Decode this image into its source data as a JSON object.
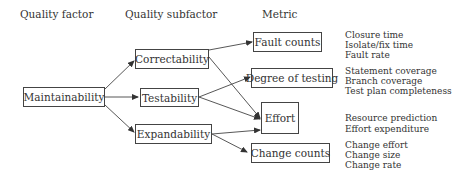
{
  "headers": {
    "quality_factor": "Quality factor",
    "quality_subfactor": "Quality subfactor",
    "metric": "Metric"
  },
  "factor": {
    "label": "Maintainability"
  },
  "subfactors": [
    {
      "id": "correctability",
      "label": "Correctability"
    },
    {
      "id": "testability",
      "label": "Testability"
    },
    {
      "id": "expandability",
      "label": "Expandability"
    }
  ],
  "metrics": [
    {
      "id": "fault-counts",
      "label": "Fault counts",
      "details": [
        "Closure time",
        "Isolate/fix time",
        "Fault rate"
      ]
    },
    {
      "id": "degree-of-testing",
      "label": "Degree of testing",
      "details": [
        "Statement coverage",
        "Branch coverage",
        "Test plan completeness"
      ]
    },
    {
      "id": "effort",
      "label": "Effort",
      "details": [
        "Resource prediction",
        "Effort expenditure"
      ]
    },
    {
      "id": "change-counts",
      "label": "Change counts",
      "details": [
        "Change effort",
        "Change size",
        "Change rate"
      ]
    }
  ],
  "edges": [
    [
      "Maintainability",
      "Correctability"
    ],
    [
      "Maintainability",
      "Testability"
    ],
    [
      "Maintainability",
      "Expandability"
    ],
    [
      "Correctability",
      "Fault counts"
    ],
    [
      "Correctability",
      "Effort"
    ],
    [
      "Testability",
      "Degree of testing"
    ],
    [
      "Testability",
      "Effort"
    ],
    [
      "Expandability",
      "Effort"
    ],
    [
      "Expandability",
      "Change counts"
    ]
  ]
}
